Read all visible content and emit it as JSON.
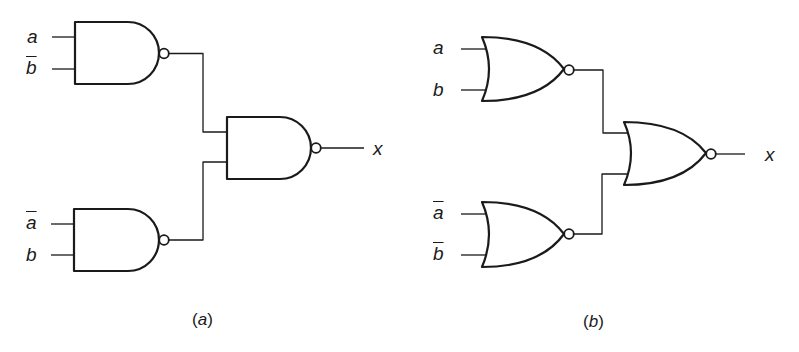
{
  "diagram": {
    "type": "logic-circuit",
    "panels": [
      {
        "id": "a",
        "caption_open": "(",
        "caption_letter": "a",
        "caption_close": ")",
        "gate_type": "NAND",
        "inputs": [
          {
            "gate": "nand-1",
            "label": "a",
            "negated": false
          },
          {
            "gate": "nand-1",
            "label": "b",
            "negated": true
          },
          {
            "gate": "nand-2",
            "label": "a",
            "negated": true
          },
          {
            "gate": "nand-2",
            "label": "b",
            "negated": false
          }
        ],
        "output_label": "x"
      },
      {
        "id": "b",
        "caption_open": "(",
        "caption_letter": "b",
        "caption_close": ")",
        "gate_type": "NOR",
        "inputs": [
          {
            "gate": "nor-1",
            "label": "a",
            "negated": false
          },
          {
            "gate": "nor-1",
            "label": "b",
            "negated": false
          },
          {
            "gate": "nor-2",
            "label": "a",
            "negated": true
          },
          {
            "gate": "nor-2",
            "label": "b",
            "negated": true
          }
        ],
        "output_label": "x"
      }
    ]
  },
  "colors": {
    "stroke": "#1a1a1a",
    "background": "#ffffff"
  }
}
